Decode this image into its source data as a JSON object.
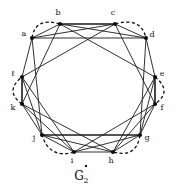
{
  "figure": {
    "caption_letter": "G",
    "caption_subscript": "2",
    "caption_accent": "dot",
    "accent_icon": "dot-accent-icon",
    "background_color": "#ffffff",
    "ink_color": "#111111"
  },
  "graph": {
    "type": "undirected-graph",
    "vertex_count": 12,
    "vertices": [
      {
        "id": "a",
        "label": "a",
        "x": 32.0,
        "y": 38.0,
        "label_x": 24.0,
        "label_y": 36.0
      },
      {
        "id": "b",
        "label": "b",
        "x": 60.0,
        "y": 24.0,
        "label_x": 58.0,
        "label_y": 15.0
      },
      {
        "id": "c",
        "label": "c",
        "x": 115.0,
        "y": 24.0,
        "label_x": 113.0,
        "label_y": 15.0
      },
      {
        "id": "d",
        "label": "d",
        "x": 146.0,
        "y": 38.0,
        "label_x": 152.0,
        "label_y": 37.0
      },
      {
        "id": "e",
        "label": "e",
        "x": 155.0,
        "y": 77.0,
        "label_x": 162.0,
        "label_y": 76.0
      },
      {
        "id": "f",
        "label": "f",
        "x": 155.0,
        "y": 104.0,
        "label_x": 162.0,
        "label_y": 110.0
      },
      {
        "id": "g",
        "label": "g",
        "x": 140.0,
        "y": 135.0,
        "label_x": 147.0,
        "label_y": 140.0
      },
      {
        "id": "h",
        "label": "h",
        "x": 113.0,
        "y": 152.0,
        "label_x": 111.0,
        "label_y": 163.0
      },
      {
        "id": "i",
        "label": "i",
        "x": 74.0,
        "y": 152.0,
        "label_x": 72.0,
        "label_y": 163.0
      },
      {
        "id": "j",
        "label": "j",
        "x": 42.0,
        "y": 135.0,
        "label_x": 34.0,
        "label_y": 140.0
      },
      {
        "id": "k",
        "label": "k",
        "x": 22.0,
        "y": 104.0,
        "label_x": 13.0,
        "label_y": 110.0
      },
      {
        "id": "l",
        "label": "ℓ",
        "x": 22.0,
        "y": 77.0,
        "label_x": 13.0,
        "label_y": 76.0
      }
    ],
    "solid_edges": [
      [
        "a",
        "b"
      ],
      [
        "b",
        "c"
      ],
      [
        "c",
        "d"
      ],
      [
        "d",
        "e"
      ],
      [
        "e",
        "f"
      ],
      [
        "f",
        "g"
      ],
      [
        "g",
        "h"
      ],
      [
        "h",
        "i"
      ],
      [
        "i",
        "j"
      ],
      [
        "j",
        "k"
      ],
      [
        "k",
        "l"
      ],
      [
        "l",
        "a"
      ],
      [
        "a",
        "d"
      ],
      [
        "b",
        "e"
      ],
      [
        "c",
        "f"
      ],
      [
        "d",
        "g"
      ],
      [
        "e",
        "h"
      ],
      [
        "f",
        "i"
      ],
      [
        "g",
        "j"
      ],
      [
        "h",
        "k"
      ],
      [
        "i",
        "l"
      ],
      [
        "j",
        "a"
      ],
      [
        "k",
        "b"
      ],
      [
        "l",
        "c"
      ],
      [
        "a",
        "c"
      ],
      [
        "b",
        "d"
      ],
      [
        "e",
        "g"
      ],
      [
        "f",
        "h"
      ],
      [
        "i",
        "k"
      ],
      [
        "j",
        "l"
      ],
      [
        "g",
        "i"
      ],
      [
        "h",
        "j"
      ]
    ],
    "thick_edges": [
      [
        "b",
        "c"
      ],
      [
        "e",
        "f"
      ],
      [
        "k",
        "l"
      ],
      [
        "j",
        "g"
      ]
    ],
    "dashed_arcs": [
      {
        "from": "a",
        "to": "b",
        "bulge": 9
      },
      {
        "from": "c",
        "to": "d",
        "bulge": 9
      },
      {
        "from": "e",
        "to": "f",
        "bulge": 9
      },
      {
        "from": "g",
        "to": "h",
        "bulge": 9
      },
      {
        "from": "i",
        "to": "j",
        "bulge": 9
      },
      {
        "from": "k",
        "to": "l",
        "bulge": 9
      }
    ]
  }
}
